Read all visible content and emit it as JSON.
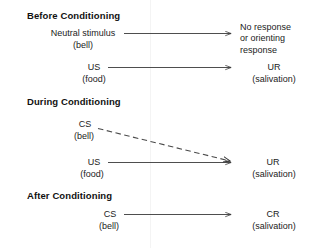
{
  "figure": {
    "background_color": "#ffffff",
    "line_color": "#3a3a3a"
  },
  "sections": [
    {
      "heading": "Before Conditioning",
      "rows": [
        {
          "stimulus_label": "Neutral stimulus",
          "stimulus_sub": "(bell)",
          "arrow_style": "solid",
          "response_label": "No response",
          "response_line2": "or orienting",
          "response_line3": "response"
        },
        {
          "stimulus_label": "US",
          "stimulus_sub": "(food)",
          "arrow_style": "solid",
          "response_label": "UR",
          "response_sub": "(salivation)"
        }
      ]
    },
    {
      "heading": "During Conditioning",
      "rows": [
        {
          "stimulus_label": "CS",
          "stimulus_sub": "(bell)",
          "arrow_style": "dashed",
          "response_label": "UR",
          "response_sub": "(salivation)"
        },
        {
          "stimulus_label": "US",
          "stimulus_sub": "(food)",
          "arrow_style": "solid"
        }
      ]
    },
    {
      "heading": "After Conditioning",
      "rows": [
        {
          "stimulus_label": "CS",
          "stimulus_sub": "(bell)",
          "arrow_style": "solid",
          "response_label": "CR",
          "response_sub": "(salivation)"
        }
      ]
    }
  ]
}
